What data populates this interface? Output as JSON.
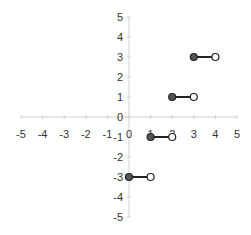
{
  "chart_data": {
    "type": "line",
    "title": "",
    "xlabel": "",
    "ylabel": "",
    "xlim": [
      -5,
      5
    ],
    "ylim": [
      -5,
      5
    ],
    "grid": false,
    "legend": null,
    "x_ticks": [
      "-5",
      "-4",
      "-3",
      "-2",
      "-1",
      "0",
      "1",
      "2",
      "3",
      "4",
      "5"
    ],
    "y_ticks": [
      "5",
      "4",
      "3",
      "2",
      "1",
      "0",
      "-1",
      "-2",
      "-3",
      "-4",
      "-5"
    ],
    "series": [
      {
        "name": "segment-1",
        "x": [
          3,
          4
        ],
        "y": [
          3,
          3
        ],
        "start": "closed",
        "end": "open"
      },
      {
        "name": "segment-2",
        "x": [
          2,
          3
        ],
        "y": [
          1,
          1
        ],
        "start": "closed",
        "end": "open"
      },
      {
        "name": "segment-3",
        "x": [
          1,
          2
        ],
        "y": [
          -1,
          -1
        ],
        "start": "closed",
        "end": "open"
      },
      {
        "name": "segment-4",
        "x": [
          0,
          1
        ],
        "y": [
          -3,
          -3
        ],
        "start": "closed",
        "end": "open"
      }
    ],
    "colors": {
      "axis": "#d0d0d0",
      "line": "#222222",
      "closed_fill": "#555555",
      "open_fill": "#ffffff"
    }
  }
}
